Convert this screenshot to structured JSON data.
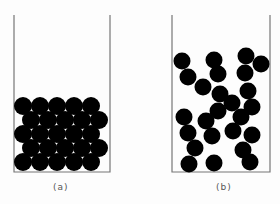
{
  "figure": {
    "panels": [
      {
        "label": "(a)",
        "description": "ordered close-packed spheres in container",
        "container": {
          "left": 14,
          "right": 110,
          "top": 15,
          "bottom": 172
        },
        "ball_radius": 9,
        "balls": [
          [
            23,
            106
          ],
          [
            40,
            106
          ],
          [
            57,
            106
          ],
          [
            74,
            106
          ],
          [
            91,
            106
          ],
          [
            31,
            120
          ],
          [
            48,
            120
          ],
          [
            65,
            120
          ],
          [
            82,
            120
          ],
          [
            99,
            120
          ],
          [
            23,
            134
          ],
          [
            40,
            134
          ],
          [
            57,
            134
          ],
          [
            74,
            134
          ],
          [
            91,
            134
          ],
          [
            31,
            148
          ],
          [
            48,
            148
          ],
          [
            65,
            148
          ],
          [
            82,
            148
          ],
          [
            99,
            148
          ],
          [
            23,
            162
          ],
          [
            40,
            162
          ],
          [
            57,
            162
          ],
          [
            74,
            162
          ],
          [
            91,
            162
          ]
        ]
      },
      {
        "label": "(b)",
        "description": "randomly arranged spheres in container",
        "container": {
          "left": 172,
          "right": 270,
          "top": 15,
          "bottom": 172
        },
        "ball_radius": 8.5,
        "balls": [
          [
            182,
            61
          ],
          [
            214,
            60
          ],
          [
            246,
            56
          ],
          [
            261,
            64
          ],
          [
            188,
            77
          ],
          [
            218,
            74
          ],
          [
            245,
            73
          ],
          [
            203,
            87
          ],
          [
            220,
            94
          ],
          [
            248,
            91
          ],
          [
            232,
            103
          ],
          [
            252,
            107
          ],
          [
            218,
            111
          ],
          [
            241,
            117
          ],
          [
            184,
            117
          ],
          [
            206,
            121
          ],
          [
            233,
            131
          ],
          [
            188,
            133
          ],
          [
            212,
            136
          ],
          [
            252,
            135
          ],
          [
            195,
            148
          ],
          [
            243,
            150
          ],
          [
            189,
            164
          ],
          [
            214,
            163
          ],
          [
            250,
            162
          ]
        ]
      }
    ],
    "colors": {
      "ball": "#000000",
      "wall": "#777777",
      "background": "#fdfdfd"
    }
  }
}
